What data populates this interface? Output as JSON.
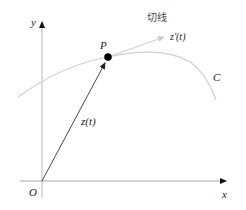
{
  "diagram": {
    "type": "complex-plane-tangent-vector",
    "axes": {
      "x_label": "x",
      "y_label": "y",
      "origin_label": "O",
      "color": "#bfbfbf"
    },
    "curve": {
      "label": "C",
      "color": "#cccccc"
    },
    "point": {
      "label": "P",
      "color": "#000000"
    },
    "position_vector": {
      "label": "z(t)",
      "color": "#333333"
    },
    "tangent": {
      "title": "切线",
      "vector_label": "z'(t)",
      "color": "#cccccc"
    }
  }
}
